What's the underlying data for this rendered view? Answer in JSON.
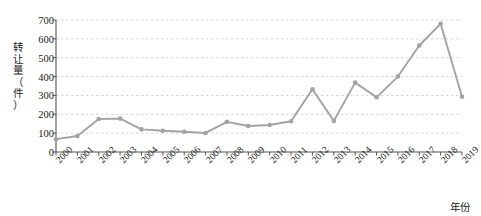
{
  "chart_data": {
    "type": "line",
    "title": "",
    "subtitle": "",
    "xlabel": "年份",
    "ylabel": "转让量（件）",
    "ylabel_chars": [
      "转",
      "让",
      "量",
      "（",
      "件",
      "）"
    ],
    "categories": [
      "2000",
      "2001",
      "2002",
      "2003",
      "2004",
      "2005",
      "2006",
      "2007",
      "2008",
      "2009",
      "2010",
      "2011",
      "2012",
      "2013",
      "2014",
      "2015",
      "2016",
      "2017",
      "2018",
      "2019"
    ],
    "values": [
      68,
      85,
      175,
      177,
      120,
      113,
      107,
      101,
      160,
      138,
      143,
      163,
      333,
      165,
      368,
      290,
      400,
      565,
      680,
      293
    ],
    "series": [
      {
        "name": "转让量",
        "values": [
          68,
          85,
          175,
          177,
          120,
          113,
          107,
          101,
          160,
          138,
          143,
          163,
          333,
          165,
          368,
          290,
          400,
          565,
          680,
          293
        ]
      }
    ],
    "ylim": [
      0,
      700
    ],
    "y_ticks": [
      0,
      100,
      200,
      300,
      400,
      500,
      600,
      700
    ],
    "y_tick_labels": [
      "0",
      "100",
      "200",
      "300",
      "400",
      "500",
      "600",
      "700"
    ],
    "grid": "horizontal-dashed",
    "legend": "none",
    "line_color": "#a3a3a3",
    "marker_color": "#a3a3a3",
    "marker_shape": "circle",
    "axis_color": "#555555",
    "grid_color": "#c9c9c9",
    "text_color": "#1a1a1a"
  }
}
